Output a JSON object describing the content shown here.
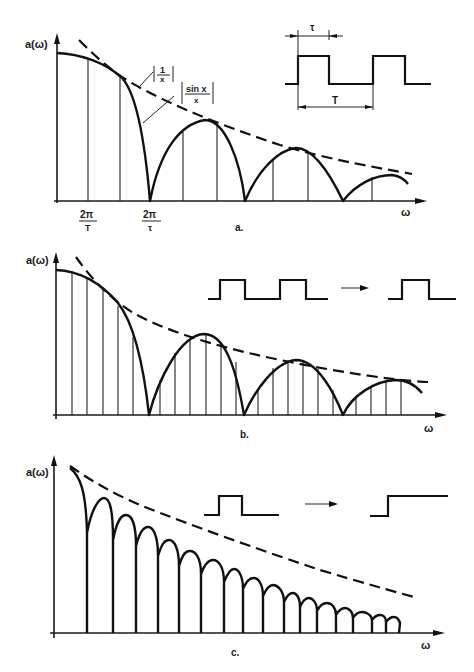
{
  "figure": {
    "panels": [
      {
        "id": "a",
        "caption": "a.",
        "y_label": "a(ω)",
        "x_label": "ω",
        "tick_labels": [
          {
            "num": "2π",
            "den": "T",
            "x": 87
          },
          {
            "num": "2π",
            "den": "τ",
            "x": 150
          }
        ],
        "annotations": [
          {
            "text_num": "1",
            "text_den": "x",
            "meaning": "envelope |1/x|"
          },
          {
            "text_num": "sin x",
            "text_den": "x",
            "meaning": "spectrum |sin x / x|"
          }
        ],
        "inset": {
          "description": "periodic rectangular pulse train",
          "tau_label": "τ",
          "period_label": "T"
        },
        "spectral_line_spacing": "2π/T",
        "first_zero": "2π/τ"
      },
      {
        "id": "b",
        "caption": "b.",
        "y_label": "a(ω)",
        "x_label": "ω",
        "inset": {
          "description": "pulse train with longer period → single pulse",
          "arrow": "→"
        }
      },
      {
        "id": "c",
        "caption": "c.",
        "y_label": "a(ω)",
        "x_label": "ω",
        "inset": {
          "description": "single pulse → unit step",
          "arrow": "→"
        }
      }
    ]
  }
}
